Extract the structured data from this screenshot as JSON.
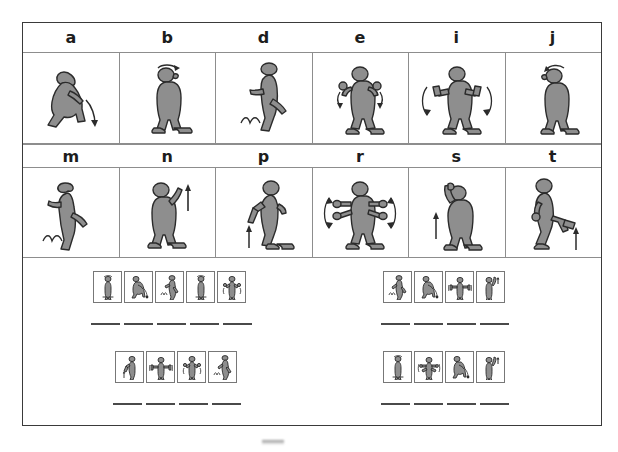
{
  "worksheet": {
    "title": "Exercise action picture-letter matching worksheet",
    "ink_color": "#3a3a3a",
    "figure_fill": "#8e8e8e",
    "grid_line_color": "#8d8d8d"
  },
  "key_table": {
    "rows": [
      {
        "letters": [
          "a",
          "b",
          "d",
          "e",
          "i",
          "j"
        ],
        "figures": [
          {
            "letter": "a",
            "action": "squatting-figure-with-down-arrow"
          },
          {
            "letter": "b",
            "action": "standing-figure-head-turn-arrow"
          },
          {
            "letter": "d",
            "action": "hopping-figure-on-one-leg"
          },
          {
            "letter": "e",
            "action": "figure-arms-bent-shoulder-circles"
          },
          {
            "letter": "i",
            "action": "figure-arms-out-holding-weights"
          },
          {
            "letter": "j",
            "action": "standing-figure-head-nod-arrow"
          }
        ]
      },
      {
        "letters": [
          "m",
          "n",
          "p",
          "r",
          "s",
          "t"
        ],
        "figures": [
          {
            "letter": "m",
            "action": "jumping-figure-bouncing"
          },
          {
            "letter": "n",
            "action": "figure-one-arm-raised-up-arrow"
          },
          {
            "letter": "p",
            "action": "figure-knee-lift-up-arrow"
          },
          {
            "letter": "r",
            "action": "figure-arms-out-wide-swing-arrows"
          },
          {
            "letter": "s",
            "action": "figure-arm-overhead-reach-arrow"
          },
          {
            "letter": "t",
            "action": "figure-leg-kick-out-arrow"
          }
        ]
      }
    ]
  },
  "puzzles": [
    {
      "id": "puzzle-1",
      "box_count": 5,
      "blank_count": 5,
      "pictures": [
        "standing-figure",
        "squatting-figure",
        "hopping-figure",
        "standing-figure",
        "figure-arms-bent"
      ],
      "answer_blanks": [
        "",
        "",
        "",
        "",
        ""
      ]
    },
    {
      "id": "puzzle-2",
      "box_count": 4,
      "blank_count": 4,
      "pictures": [
        "hopping-figure",
        "squatting-figure",
        "figure-holding-weights",
        "figure-arm-raised"
      ],
      "answer_blanks": [
        "",
        "",
        "",
        ""
      ]
    },
    {
      "id": "puzzle-3",
      "box_count": 4,
      "blank_count": 4,
      "pictures": [
        "figure-knee-lift",
        "figure-holding-weights",
        "figure-arms-bent",
        "hopping-figure"
      ],
      "answer_blanks": [
        "",
        "",
        "",
        ""
      ]
    },
    {
      "id": "puzzle-4",
      "box_count": 4,
      "blank_count": 4,
      "pictures": [
        "standing-figure",
        "figure-arms-out-wide",
        "squatting-figure",
        "figure-arm-raised"
      ],
      "answer_blanks": [
        "",
        "",
        "",
        ""
      ]
    }
  ]
}
